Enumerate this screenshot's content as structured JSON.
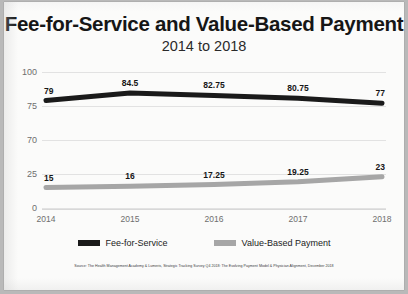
{
  "chart_data": {
    "type": "line",
    "title": "Fee-for-Service and Value-Based Payment",
    "subtitle": "2014 to 2018",
    "xlabel": "",
    "ylabel": "",
    "categories": [
      "2014",
      "2015",
      "2016",
      "2017",
      "2018"
    ],
    "x": [
      2014,
      2015,
      2016,
      2017,
      2018
    ],
    "ytick_labels": [
      "100",
      "75",
      "70",
      "25",
      "0"
    ],
    "ytick_values": [
      100,
      75,
      70,
      25,
      0
    ],
    "ylim": [
      0,
      100
    ],
    "grid": true,
    "broken_axis": true,
    "legend_position": "bottom",
    "series": [
      {
        "name": "Fee-for-Service",
        "color": "#1a1a1a",
        "values": [
          79,
          84.5,
          82.75,
          80.75,
          77
        ],
        "labels": [
          "79",
          "84.5",
          "82.75",
          "80.75",
          "77"
        ]
      },
      {
        "name": "Value-Based Payment",
        "color": "#a6a6a6",
        "values": [
          15,
          16,
          17.25,
          19.25,
          23
        ],
        "labels": [
          "15",
          "16",
          "17.25",
          "19.25",
          "23"
        ]
      }
    ],
    "source": "Source: The Health Management Academy & Lumeris, Strategic Tracking Survey Q4 2018: The Evolving Payment Model & Physician Alignment, December 2018"
  },
  "legend": [
    {
      "label": "Fee-for-Service",
      "color": "#1a1a1a"
    },
    {
      "label": "Value-Based Payment",
      "color": "#a6a6a6"
    }
  ]
}
